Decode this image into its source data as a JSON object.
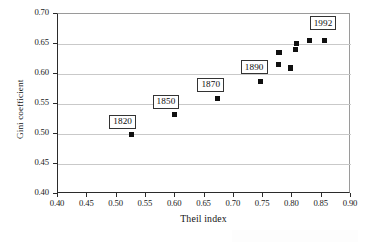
{
  "figure": {
    "background": "#ffffff",
    "marker_color": "#101010",
    "grid_color": "#c9c9c9",
    "axis_color": "#2b2b2b"
  },
  "chart_data": {
    "type": "scatter",
    "title": "",
    "subtitle": "",
    "xlabel": "Theil index",
    "ylabel": "Gini coefficient",
    "xlim": [
      0.4,
      0.9
    ],
    "ylim": [
      0.4,
      0.7
    ],
    "xticks": [
      0.4,
      0.45,
      0.5,
      0.55,
      0.6,
      0.65,
      0.7,
      0.75,
      0.8,
      0.85,
      0.9
    ],
    "yticks": [
      0.4,
      0.45,
      0.5,
      0.55,
      0.6,
      0.65,
      0.7
    ],
    "xtick_labels": [
      "0.40",
      "0.45",
      "0.50",
      "0.55",
      "0.60",
      "0.65",
      "0.70",
      "0.75",
      "0.80",
      "0.85",
      "0.90"
    ],
    "ytick_labels": [
      "0.40",
      "0.45",
      "0.50",
      "0.55",
      "0.60",
      "0.65",
      "0.70"
    ],
    "grid": {
      "horizontal": true,
      "vertical": false
    },
    "legend": {
      "visible": false,
      "position": "none"
    },
    "marker_style": "filled-square",
    "series": [
      {
        "name": "Global inequality",
        "points": [
          {
            "x": 0.525,
            "y": 0.499,
            "label": "1820"
          },
          {
            "x": 0.599,
            "y": 0.532,
            "label": "1850"
          },
          {
            "x": 0.672,
            "y": 0.559,
            "label": "1870"
          },
          {
            "x": 0.746,
            "y": 0.588,
            "label": "1890"
          },
          {
            "x": 0.776,
            "y": 0.616,
            "label": ""
          },
          {
            "x": 0.777,
            "y": 0.636,
            "label": ""
          },
          {
            "x": 0.797,
            "y": 0.61,
            "label": ""
          },
          {
            "x": 0.805,
            "y": 0.641,
            "label": ""
          },
          {
            "x": 0.807,
            "y": 0.651,
            "label": ""
          },
          {
            "x": 0.829,
            "y": 0.656,
            "label": ""
          },
          {
            "x": 0.855,
            "y": 0.656,
            "label": "1992"
          }
        ]
      }
    ],
    "annotations": [
      {
        "text": "1820",
        "x": 0.525,
        "y": 0.499
      },
      {
        "text": "1850",
        "x": 0.599,
        "y": 0.532
      },
      {
        "text": "1870",
        "x": 0.672,
        "y": 0.559
      },
      {
        "text": "1890",
        "x": 0.746,
        "y": 0.588
      },
      {
        "text": "1992",
        "x": 0.855,
        "y": 0.656
      }
    ]
  }
}
